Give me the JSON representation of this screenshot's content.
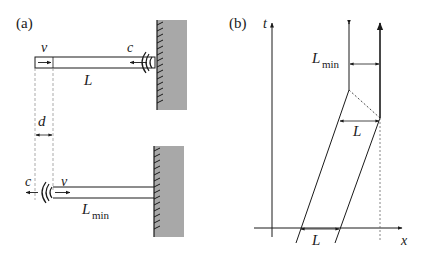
{
  "panel_a": {
    "label": "(a)",
    "top": {
      "v_label": "v",
      "c_label": "c",
      "length_label": "L"
    },
    "gap_label": "d",
    "bottom": {
      "c_label": "c",
      "v_label": "v",
      "length_label": "L",
      "length_sub": "min"
    }
  },
  "panel_b": {
    "label": "(b)",
    "t_axis": "t",
    "x_axis": "x",
    "lmin_label": "L",
    "lmin_sub": "min",
    "upper_L": "L",
    "lower_L": "L"
  },
  "colors": {
    "ink": "#1a1a1a",
    "wall": "#a8a8a8",
    "dashed": "#555555"
  }
}
